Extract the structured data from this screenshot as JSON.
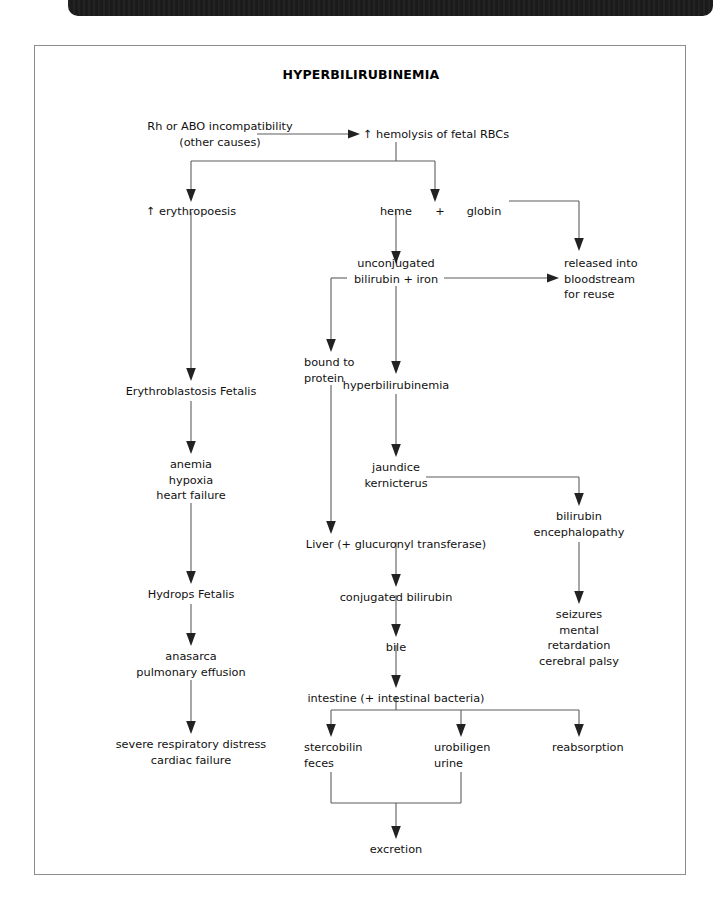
{
  "header": {
    "page_number": "252"
  },
  "figure": {
    "title": "HYPERBILIRUBINEMIA"
  },
  "nodes": [
    {
      "id": "rh-abo-incompatibility",
      "text": "Rh or ABO incompatibility\n(other causes)"
    },
    {
      "id": "hemolysis-fetal-rbcs",
      "text": "↑ hemolysis of fetal RBCs"
    },
    {
      "id": "erythropoesis",
      "text": "↑ erythropoesis"
    },
    {
      "id": "heme",
      "text": "heme"
    },
    {
      "id": "plus-sign",
      "text": "+"
    },
    {
      "id": "globin",
      "text": "globin"
    },
    {
      "id": "unconjugated-bilirubin",
      "text": "unconjugated\nbilirubin + iron"
    },
    {
      "id": "released-into-bloodstream",
      "text": "released into\nbloodstream\nfor reuse"
    },
    {
      "id": "bound-to-protein",
      "text": "bound to\nprotein"
    },
    {
      "id": "hyperbilirubinemia",
      "text": "hyperbilirubinemia"
    },
    {
      "id": "erythroblastosis-fetalis",
      "text": "Erythroblastosis Fetalis"
    },
    {
      "id": "anemia-hypoxia",
      "text": "anemia\nhypoxia\nheart failure"
    },
    {
      "id": "jaundice-kernicterus",
      "text": "jaundice\nkernicterus"
    },
    {
      "id": "bilirubin-encephalopathy",
      "text": "bilirubin\nencephalopathy"
    },
    {
      "id": "liver-glucuronyl",
      "text": "Liver (+ glucuronyl transferase)"
    },
    {
      "id": "hydrops-fetalis",
      "text": "Hydrops Fetalis"
    },
    {
      "id": "conjugated-bilirubin",
      "text": "conjugated bilirubin"
    },
    {
      "id": "seizures-mental",
      "text": "seizures\nmental\nretardation\ncerebral palsy"
    },
    {
      "id": "anasarca",
      "text": "anasarca\npulmonary effusion"
    },
    {
      "id": "bile",
      "text": "bile"
    },
    {
      "id": "intestine",
      "text": "intestine (+ intestinal bacteria)"
    },
    {
      "id": "severe-respiratory",
      "text": "severe respiratory distress\ncardiac failure"
    },
    {
      "id": "stercobilin-feces",
      "text": "stercobilin\nfeces"
    },
    {
      "id": "urobiligen-urine",
      "text": "urobiligen\nurine"
    },
    {
      "id": "reabsorption",
      "text": "reabsorption"
    },
    {
      "id": "excretion",
      "text": "excretion"
    }
  ],
  "colors": {
    "frame_border": "#8c8c8c",
    "connector": "#5d5d5d",
    "text": "#111111",
    "header_bar": "#1b1b1b"
  }
}
